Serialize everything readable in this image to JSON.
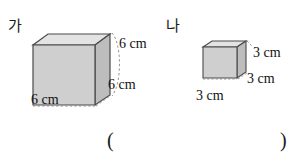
{
  "page": {
    "background_color": "#ffffff",
    "width": 304,
    "height": 162
  },
  "figures": [
    {
      "id": "figure-ga",
      "name": "가",
      "shape": "cube",
      "edge_length": "6 cm",
      "dimension_labels": {
        "height": "6 cm",
        "depth": "6 cm",
        "width": "6 cm"
      }
    },
    {
      "id": "figure-na",
      "name": "나",
      "shape": "cube",
      "edge_length": "3 cm",
      "dimension_labels": {
        "height": "3 cm",
        "depth": "3 cm",
        "width": "3 cm"
      }
    }
  ],
  "answer_field": {
    "open_paren": "(",
    "close_paren": ")"
  },
  "colors": {
    "front_face": "#cfcfcf",
    "top_face": "#e3e3e3",
    "side_face": "#bdbdbd",
    "stroke": "#4a4a4a",
    "hidden_stroke": "#8a8a8a",
    "text": "#111111"
  }
}
